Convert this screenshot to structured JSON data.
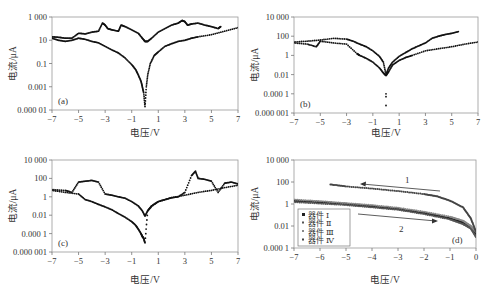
{
  "figure": {
    "panels": [
      "a",
      "b",
      "c",
      "d"
    ]
  },
  "chart_data": [
    {
      "panel": "(a)",
      "type": "scatter",
      "xlabel": "电压/V",
      "ylabel": "电流/μA",
      "yscale": "log",
      "xlim": [
        -7,
        7
      ],
      "ylim": [
        1e-05,
        1000
      ],
      "xticks": [
        "−7",
        "−5",
        "−3",
        "−1",
        "1",
        "3",
        "5",
        "7"
      ],
      "yticks": [
        "1 000",
        "10",
        "0.1",
        "0.001",
        "0.000 01"
      ],
      "grid": false,
      "series": [
        {
          "name": "sweep-high",
          "x": [
            -7,
            -6.5,
            -6,
            -5.5,
            -5,
            -4.5,
            -4,
            -3.5,
            -3.2,
            -3,
            -2.8,
            -2.5,
            -2,
            -1.8,
            -1.5,
            -1,
            -0.5,
            -0.2,
            0,
            0.2,
            0.5,
            1,
            1.5,
            2,
            2.5,
            2.8,
            3,
            3.2,
            3.5,
            4,
            4.5,
            5,
            5.5,
            5.7
          ],
          "y": [
            20,
            18,
            15,
            15,
            40,
            35,
            50,
            60,
            300,
            200,
            100,
            80,
            60,
            200,
            150,
            80,
            40,
            15,
            8,
            8,
            15,
            50,
            100,
            200,
            300,
            500,
            400,
            200,
            250,
            300,
            200,
            150,
            100,
            150
          ]
        },
        {
          "name": "sweep-low",
          "x": [
            -7,
            -6.5,
            -6,
            -5.5,
            -5,
            -4.5,
            -4,
            -3.5,
            -3,
            -2.5,
            -2,
            -1.5,
            -1,
            -0.7,
            -0.5,
            -0.3,
            -0.2,
            -0.1,
            0,
            0.1,
            0.2,
            0.4,
            0.7,
            1,
            1.5,
            2,
            2.5,
            3,
            3.5,
            4,
            5,
            6,
            7
          ],
          "y": [
            15,
            10,
            8,
            10,
            15,
            12,
            8,
            6,
            3,
            1.5,
            0.8,
            0.3,
            0.08,
            0.03,
            0.01,
            0.003,
            0.001,
            0.0003,
            2e-05,
            0.001,
            0.01,
            0.1,
            0.5,
            1,
            3,
            5,
            8,
            10,
            15,
            20,
            30,
            60,
            120
          ]
        }
      ]
    },
    {
      "panel": "(b)",
      "type": "scatter",
      "xlabel": "电压/V",
      "ylabel": "电流/μA",
      "yscale": "log",
      "xlim": [
        -7,
        7
      ],
      "ylim": [
        1e-06,
        10000
      ],
      "xticks": [
        "−7",
        "−5",
        "−3",
        "−1",
        "1",
        "3",
        "5",
        "7"
      ],
      "yticks": [
        "10 000",
        "100",
        "1",
        "0.01",
        "0.000 1",
        "0.000 001"
      ],
      "grid": false,
      "series": [
        {
          "name": "sweep-high",
          "x": [
            -7,
            -6,
            -5,
            -4,
            -3,
            -2.5,
            -2,
            -1.5,
            -1,
            -0.5,
            -0.2,
            0,
            0.2,
            0.5,
            1,
            1.5,
            2,
            2.5,
            3,
            3.5,
            4,
            4.5,
            5,
            5.5
          ],
          "y": [
            25,
            30,
            40,
            60,
            50,
            30,
            15,
            8,
            3,
            0.8,
            0.2,
            0.01,
            0.05,
            0.2,
            0.8,
            2,
            5,
            10,
            20,
            60,
            100,
            150,
            200,
            300
          ]
        },
        {
          "name": "sweep-low",
          "x": [
            -7,
            -6,
            -5.3,
            -5,
            -4,
            -3,
            -2.2,
            -2,
            -1.5,
            -1,
            -0.5,
            -0.2,
            0,
            0.2,
            0.5,
            1,
            1.5,
            2,
            3,
            4,
            5,
            6,
            7
          ],
          "y": [
            20,
            15,
            8,
            30,
            20,
            15,
            1.5,
            1,
            0.5,
            0.2,
            0.05,
            0.015,
            0.008,
            0.02,
            0.1,
            0.3,
            0.6,
            1,
            3,
            5,
            8,
            15,
            25
          ]
        },
        {
          "name": "outliers",
          "x": [
            0,
            0,
            0
          ],
          "y": [
            0.0001,
            5e-05,
            6e-06
          ]
        }
      ]
    },
    {
      "panel": "(c)",
      "type": "scatter",
      "xlabel": "电压/V",
      "ylabel": "电流/μA",
      "yscale": "log",
      "xlim": [
        -7,
        7
      ],
      "ylim": [
        1e-06,
        10000
      ],
      "xticks": [
        "−7",
        "−5",
        "−3",
        "−1",
        "1",
        "3",
        "5",
        "7"
      ],
      "yticks": [
        "10 000",
        "100",
        "1",
        "0.01",
        "0.000 1",
        "0.000 001"
      ],
      "grid": false,
      "series": [
        {
          "name": "sweep-high",
          "x": [
            -7,
            -6,
            -5.5,
            -5,
            -4.5,
            -4,
            -3.5,
            -3,
            -2.5,
            -2,
            -1.5,
            -1,
            -0.5,
            -0.2,
            0,
            0.2,
            0.5,
            1,
            1.5,
            2,
            2.5,
            3,
            3.5,
            3.8,
            4,
            4.5,
            5,
            5.5,
            6,
            6.5,
            7
          ],
          "y": [
            6,
            5,
            3,
            40,
            50,
            60,
            40,
            2,
            1.5,
            1,
            0.7,
            0.3,
            0.1,
            0.03,
            0.008,
            0.03,
            0.1,
            0.3,
            0.5,
            0.8,
            1,
            3,
            200,
            600,
            100,
            80,
            50,
            3,
            30,
            40,
            25
          ]
        },
        {
          "name": "sweep-low",
          "x": [
            -7,
            -6,
            -5,
            -4.5,
            -4,
            -3.5,
            -3,
            -2.5,
            -2,
            -1.5,
            -1,
            -0.7,
            -0.5,
            -0.3,
            -0.2,
            -0.1,
            0,
            0.2,
            0.5,
            1,
            2,
            3,
            4,
            5,
            6,
            7
          ],
          "y": [
            5,
            3,
            2,
            0.5,
            0.3,
            0.15,
            0.08,
            0.04,
            0.015,
            0.006,
            0.002,
            0.0008,
            0.0003,
            0.0001,
            5e-05,
            3e-05,
            1e-05,
            0.03,
            0.1,
            0.3,
            0.8,
            1.5,
            3,
            5,
            10,
            18
          ]
        }
      ]
    },
    {
      "panel": "(d)",
      "type": "scatter",
      "xlabel": "电压/V",
      "ylabel": "电流/μA",
      "yscale": "log",
      "xlim": [
        -7,
        0
      ],
      "ylim": [
        0.0001,
        10000
      ],
      "xticks": [
        "−7",
        "−6",
        "−5",
        "−4",
        "−3",
        "−2",
        "−1",
        "0"
      ],
      "yticks": [
        "10 000",
        "100",
        "1",
        "0.01",
        "0.000 1"
      ],
      "grid": false,
      "legend": {
        "position": "lower-left",
        "entries": [
          "器件 Ⅰ",
          "器件 Ⅱ",
          "器件 Ⅲ",
          "器件 Ⅳ"
        ]
      },
      "annotations": [
        {
          "text": "1",
          "arrow": "right-to-left",
          "near_x": -2.5
        },
        {
          "text": "2",
          "arrow": "left-to-right",
          "near_x": -3
        }
      ],
      "series": [
        {
          "name": "器件 Ⅰ",
          "x": [
            -7,
            -6,
            -5,
            -4,
            -3,
            -2,
            -1,
            -0.5,
            -0.2,
            0
          ],
          "y": [
            2,
            1.5,
            1,
            0.6,
            0.35,
            0.15,
            0.05,
            0.02,
            0.008,
            0.002
          ]
        },
        {
          "name": "器件 Ⅱ",
          "x": [
            -7,
            -6,
            -5,
            -4,
            -3,
            -2,
            -1,
            -0.5,
            -0.2,
            0
          ],
          "y": [
            1.5,
            1.1,
            0.8,
            0.5,
            0.3,
            0.12,
            0.04,
            0.015,
            0.006,
            0.001
          ]
        },
        {
          "name": "器件 Ⅲ",
          "x": [
            -7,
            -6,
            -5,
            -4,
            -3,
            -2,
            -1,
            -0.5,
            -0.2,
            0
          ],
          "y": [
            2.5,
            1.8,
            1.2,
            0.8,
            0.45,
            0.2,
            0.07,
            0.03,
            0.01,
            0.003
          ]
        },
        {
          "name": "器件 Ⅳ",
          "x": [
            -5.6,
            -5,
            -4,
            -3,
            -2,
            -1.5,
            -1,
            -0.5,
            -0.2,
            0
          ],
          "y": [
            60,
            40,
            25,
            15,
            8,
            5,
            2,
            0.5,
            0.05,
            0.003
          ]
        }
      ]
    }
  ],
  "labels": {
    "panel_a": "(a)",
    "panel_b": "(b)",
    "panel_c": "(c)",
    "panel_d": "(d)",
    "xlabel": "电压/V",
    "ylabel": "电流/μA",
    "ann1": "1",
    "ann2": "2",
    "legend": [
      "器件 Ⅰ",
      "器件 Ⅱ",
      "器件 Ⅲ",
      "器件 Ⅳ"
    ]
  }
}
